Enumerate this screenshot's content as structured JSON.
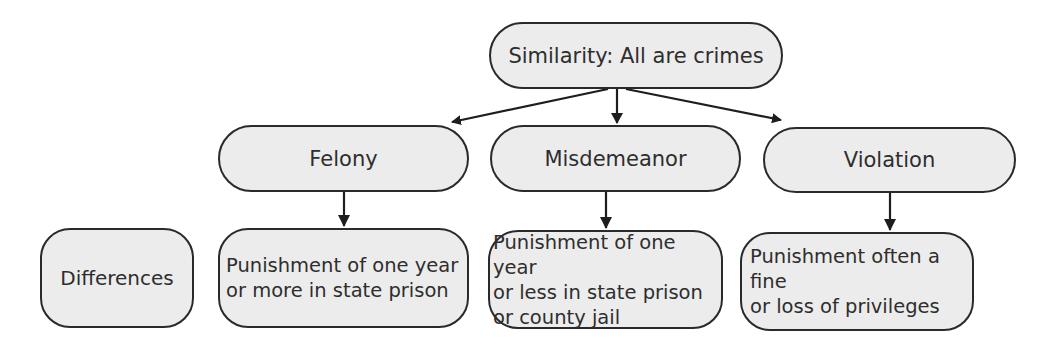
{
  "diagram": {
    "root": {
      "label": "Similarity: All are crimes"
    },
    "categories": [
      {
        "label": "Felony",
        "detail": "Punishment of one year\nor more in state prison"
      },
      {
        "label": "Misdemeanor",
        "detail": "Punishment of one year\nor less in state prison\nor county jail"
      },
      {
        "label": "Violation",
        "detail": "Punishment often a fine\nor loss of privileges"
      }
    ],
    "row_label": "Differences",
    "colors": {
      "fill": "#ececec",
      "stroke": "#2a2a2a",
      "text": "#2e2e2e"
    }
  }
}
